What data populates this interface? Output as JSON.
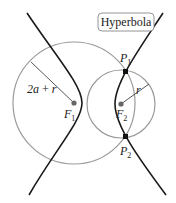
{
  "title_box": {
    "label": "Hyperbola"
  },
  "labels": {
    "big_radius": {
      "main": "2a",
      "op": " + ",
      "var": "r"
    },
    "small_radius": "r",
    "focus1": {
      "main": "F",
      "sub": "1"
    },
    "focus2": {
      "main": "F",
      "sub": "2"
    },
    "p1": {
      "main": "P",
      "sub": "1"
    },
    "p2": {
      "main": "P",
      "sub": "2"
    }
  },
  "colors": {
    "hyperbola": "#1a1a1a",
    "circle": "#9a9a9a",
    "point": "#111111",
    "focus": "#666666",
    "box_border": "#888888"
  }
}
